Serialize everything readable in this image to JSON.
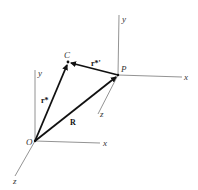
{
  "diagram": {
    "type": "vector-diagram",
    "points": {
      "O": {
        "label": "O",
        "x": 35,
        "y": 141
      },
      "C": {
        "label": "C",
        "x": 68,
        "y": 62
      },
      "P": {
        "label": "P",
        "x": 118,
        "y": 75
      }
    },
    "frame_O_axes": {
      "x": "x",
      "y": "y",
      "z": "z"
    },
    "frame_P_axes": {
      "x": "x",
      "y": "y",
      "z": "z"
    },
    "vectors": [
      {
        "name": "r*",
        "label": "r*",
        "from": "O",
        "to": "C"
      },
      {
        "name": "R",
        "label": "R",
        "from": "O",
        "to": "P"
      },
      {
        "name": "r*'",
        "label": "r*'",
        "from": "P",
        "to": "C"
      }
    ],
    "colors": {
      "axis": "#777777",
      "vector": "#111111",
      "label": "#333333"
    }
  }
}
